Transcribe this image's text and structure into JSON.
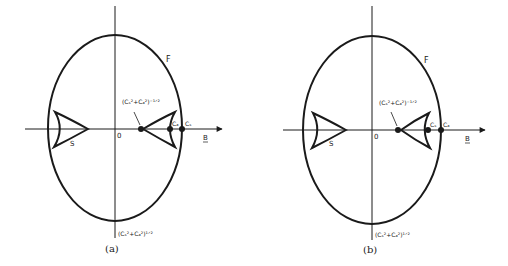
{
  "figure": {
    "panels": [
      {
        "id": "a",
        "caption": "(a)",
        "curve_F_label": "F",
        "curve_S_label": "S",
        "origin_label": "0",
        "axis_label": "B",
        "inner_point_label": "(C_S^2 + C_A^2)^-1/2",
        "inner_point_base": "(C",
        "inner_point_text": "(Cₛ²+Cₐ²)⁻¹ᐟ²",
        "bottom_label_text": "(Cₛ²+Cₐ²)¹ᐟ²",
        "point_near_label": "C_A",
        "point_near_text": "Cₐ",
        "point_far_label": "C_S",
        "point_far_text": "Cₛ"
      },
      {
        "id": "b",
        "caption": "(b)",
        "curve_F_label": "F",
        "curve_S_label": "S",
        "origin_label": "0",
        "axis_label": "B",
        "inner_point_label": "(C_S^2 + C_A^2)^-1/2",
        "inner_point_text": "(Cₛ²+Cₐ²)⁻¹ᐟ²",
        "bottom_label_text": "(Cₛ²+Cₐ²)¹ᐟ²",
        "point_near_label": "C_S",
        "point_near_text": "Cₛ",
        "point_far_label": "C_A",
        "point_far_text": "Cₐ"
      }
    ],
    "colors": {
      "stroke": "#1a1a1a",
      "background": "#ffffff"
    }
  }
}
